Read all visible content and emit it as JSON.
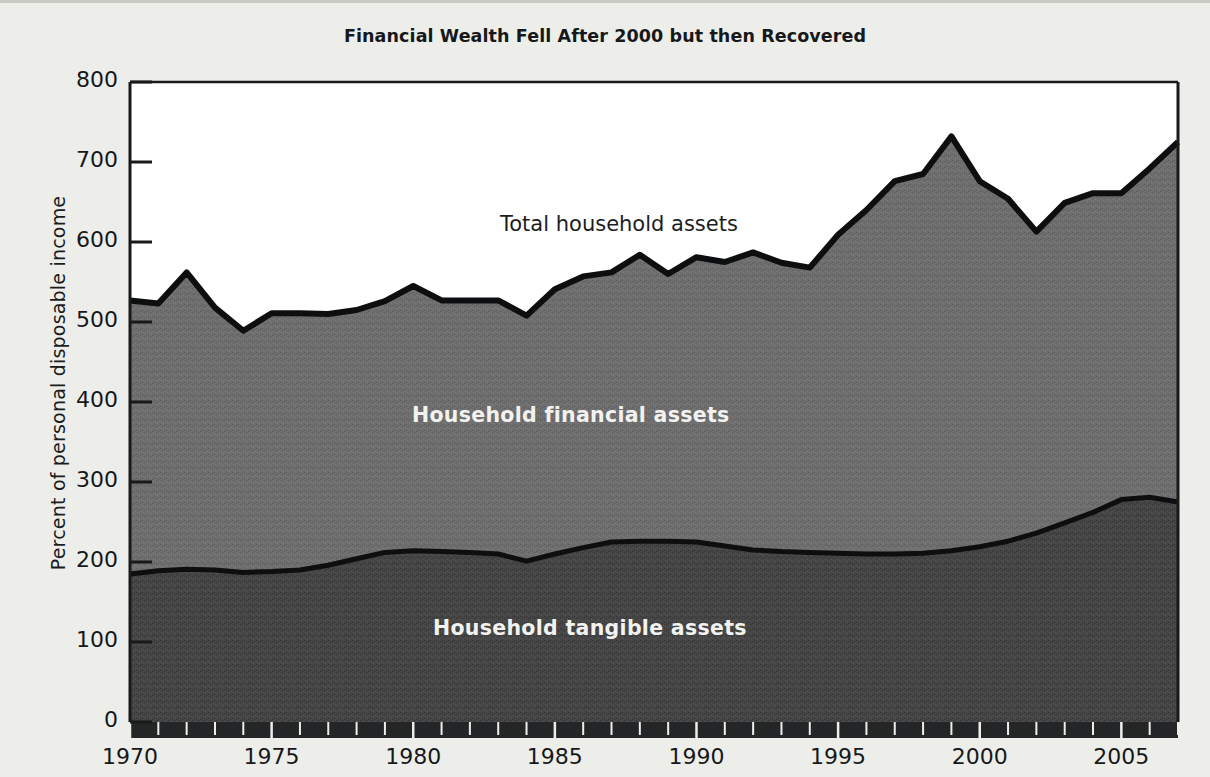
{
  "figure": {
    "title": "Financial Wealth Fell After 2000 but then Recovered",
    "background_color": "#edeeea"
  },
  "labels": {
    "total": "Total household assets",
    "financial": "Household financial assets",
    "tangible": "Household tangible assets"
  },
  "chart_data": {
    "type": "area",
    "title": "Financial Wealth Fell After 2000 but then Recovered",
    "xlabel": "",
    "ylabel": "Percent of personal disposable income",
    "xlim": [
      1970,
      2007
    ],
    "ylim": [
      0,
      800
    ],
    "ytick_labels": [
      "0",
      "100",
      "200",
      "300",
      "400",
      "500",
      "600",
      "700",
      "800"
    ],
    "ytick_values": [
      0,
      100,
      200,
      300,
      400,
      500,
      600,
      700,
      800
    ],
    "xtick_labels": [
      "1970",
      "1975",
      "1980",
      "1985",
      "1990",
      "1995",
      "2000",
      "2005"
    ],
    "xtick_values": [
      1970,
      1975,
      1980,
      1985,
      1990,
      1995,
      2000,
      2005
    ],
    "minor_xticks": "annual",
    "grid": false,
    "legend_position": "inline-annotations",
    "stacked": true,
    "x": [
      1970,
      1971,
      1972,
      1973,
      1974,
      1975,
      1976,
      1977,
      1978,
      1979,
      1980,
      1981,
      1982,
      1983,
      1984,
      1985,
      1986,
      1987,
      1988,
      1989,
      1990,
      1991,
      1992,
      1993,
      1994,
      1995,
      1996,
      1997,
      1998,
      1999,
      2000,
      2001,
      2002,
      2003,
      2004,
      2005,
      2006,
      2007
    ],
    "series": [
      {
        "name": "Household tangible assets",
        "color": "#454545",
        "values": [
          185,
          189,
          191,
          190,
          187,
          188,
          190,
          196,
          204,
          212,
          214,
          213,
          212,
          210,
          201,
          210,
          218,
          225,
          226,
          226,
          225,
          220,
          215,
          213,
          212,
          211,
          210,
          210,
          211,
          214,
          219,
          226,
          236,
          249,
          262,
          278,
          281,
          275
        ]
      },
      {
        "name": "Household financial assets",
        "color": "#6e6e6e",
        "values": [
          342,
          334,
          371,
          328,
          302,
          323,
          321,
          314,
          311,
          314,
          331,
          314,
          315,
          317,
          307,
          331,
          339,
          337,
          358,
          334,
          356,
          355,
          372,
          361,
          356,
          398,
          430,
          466,
          474,
          518,
          457,
          428,
          377,
          400,
          399,
          383,
          411,
          450
        ]
      }
    ],
    "total": {
      "name": "Total household assets",
      "values": [
        527,
        523,
        562,
        518,
        489,
        511,
        511,
        510,
        515,
        526,
        545,
        527,
        527,
        527,
        508,
        541,
        557,
        562,
        584,
        560,
        581,
        575,
        587,
        574,
        568,
        609,
        640,
        676,
        685,
        732,
        676,
        654,
        613,
        649,
        661,
        661,
        692,
        725
      ]
    }
  }
}
